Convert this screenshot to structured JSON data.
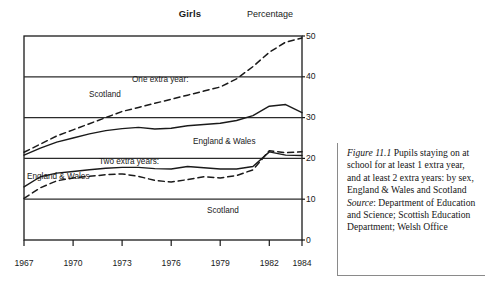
{
  "chart_data": {
    "type": "line",
    "title": "Girls",
    "ylabel": "Percentage",
    "xlabel": "",
    "xlim": [
      1967,
      1984
    ],
    "ylim": [
      0,
      50
    ],
    "xticks": [
      1967,
      1970,
      1973,
      1976,
      1979,
      1982,
      1984
    ],
    "yticks": [
      0,
      10,
      20,
      30,
      40,
      50
    ],
    "grid": "horizontal",
    "legend_position": "inline-annotations",
    "x": [
      1967,
      1968,
      1969,
      1970,
      1971,
      1972,
      1973,
      1974,
      1975,
      1976,
      1977,
      1978,
      1979,
      1980,
      1981,
      1982,
      1983,
      1984
    ],
    "series": [
      {
        "name": "One extra year: Scotland",
        "group": "One extra year:",
        "region": "Scotland",
        "style": "dashed",
        "values": [
          21.5,
          23.5,
          25.5,
          27.0,
          28.5,
          30.0,
          31.5,
          32.5,
          33.5,
          34.5,
          35.5,
          36.5,
          37.5,
          39.5,
          42.5,
          46.0,
          48.5,
          49.5
        ]
      },
      {
        "name": "One extra year: England & Wales",
        "group": "One extra year:",
        "region": "England & Wales",
        "style": "solid",
        "values": [
          20.8,
          22.5,
          24.0,
          25.0,
          26.0,
          26.8,
          27.3,
          27.6,
          27.2,
          27.4,
          28.0,
          28.3,
          28.6,
          29.3,
          30.5,
          32.8,
          33.2,
          31.2
        ]
      },
      {
        "name": "Two extra years: England & Wales",
        "group": "Two extra years:",
        "region": "England & Wales",
        "style": "solid",
        "values": [
          13.0,
          15.5,
          16.4,
          16.8,
          17.2,
          17.6,
          17.8,
          17.8,
          17.5,
          17.4,
          18.0,
          17.7,
          17.4,
          17.4,
          18.0,
          21.6,
          20.8,
          20.7
        ]
      },
      {
        "name": "Two extra years: Scotland",
        "group": "Two extra years:",
        "region": "Scotland",
        "style": "dashed",
        "values": [
          10.2,
          12.8,
          14.5,
          15.2,
          15.6,
          16.0,
          16.2,
          15.6,
          14.6,
          14.2,
          14.8,
          15.5,
          15.2,
          15.8,
          17.2,
          21.9,
          21.4,
          21.6
        ]
      }
    ],
    "annotations": [
      {
        "id": "one-extra-year",
        "text": "One extra year:"
      },
      {
        "id": "scotland-one",
        "text": "Scotland"
      },
      {
        "id": "england-wales-one",
        "text": "England & Wales"
      },
      {
        "id": "two-extra-years",
        "text": "Two extra years:"
      },
      {
        "id": "england-wales-two",
        "text": "England & Wales"
      },
      {
        "id": "scotland-two",
        "text": "Scotland"
      }
    ],
    "colors": {
      "line": "#1a1a1a",
      "grid": "#2b2b2b",
      "axis": "#1a1a1a",
      "background": "#ffffff"
    }
  },
  "caption": {
    "figure_label": "Figure 11.1",
    "description": "Pupils staying on at school for at least 1 extra year, and at least 2 extra years: by sex, England & Wales and Scotland",
    "source_label": "Source",
    "source_text": ": Department of Education and Science; Scottish Education Department; Welsh Office"
  }
}
